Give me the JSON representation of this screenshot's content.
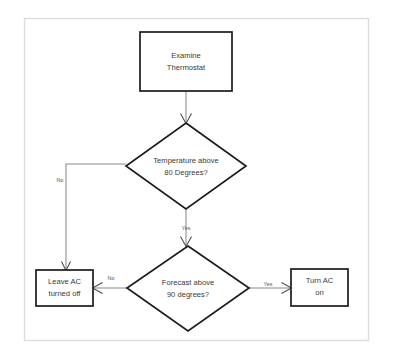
{
  "diagram": {
    "background_color": "#ffffff",
    "frame_color": "#dcdcdc",
    "shape_stroke_color": "#1c1c1c",
    "connector_color": "#8a8a8a",
    "text_color": "#3a3a3a",
    "nodes": [
      {
        "id": "examine",
        "type": "process",
        "lines": [
          "Examine",
          "Thermostat"
        ],
        "line1": "Examine",
        "line2": "Thermostat"
      },
      {
        "id": "temp-decision",
        "type": "decision",
        "lines": [
          "Temperature above",
          "80 Degrees?"
        ],
        "line1": "Temperature above",
        "line2": "80 Degrees?"
      },
      {
        "id": "forecast-decision",
        "type": "decision",
        "lines": [
          "Forecast above",
          "90 degrees?"
        ],
        "line1": "Forecast above",
        "line2": "90 degrees?"
      },
      {
        "id": "leave-off",
        "type": "process",
        "lines": [
          "Leave AC",
          "turned off"
        ],
        "line1": "Leave AC",
        "line2": "turned off"
      },
      {
        "id": "turn-on",
        "type": "process",
        "lines": [
          "Turn AC",
          "on"
        ],
        "line1": "Turn AC",
        "line2": "on"
      }
    ],
    "edges": [
      {
        "id": "examine-to-temp",
        "from": "examine",
        "to": "temp-decision",
        "label": ""
      },
      {
        "id": "temp-no",
        "from": "temp-decision",
        "to": "leave-off",
        "label": "No"
      },
      {
        "id": "temp-yes",
        "from": "temp-decision",
        "to": "forecast-decision",
        "label": "Yes"
      },
      {
        "id": "forecast-no",
        "from": "forecast-decision",
        "to": "leave-off",
        "label": "No"
      },
      {
        "id": "forecast-yes",
        "from": "forecast-decision",
        "to": "turn-on",
        "label": "Yes"
      }
    ]
  }
}
